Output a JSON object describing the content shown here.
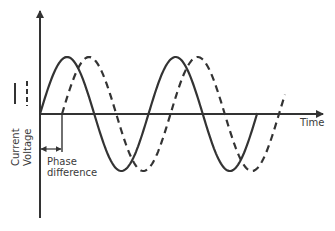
{
  "diagram": {
    "title": "",
    "axes": {
      "x_label": "Time",
      "y_label": ""
    },
    "legend": [
      {
        "name": "Current",
        "style": "solid",
        "color": "#333333"
      },
      {
        "name": "Voltage",
        "style": "dashed",
        "color": "#333333"
      }
    ],
    "annotation": {
      "line1": "Phase",
      "line2": "difference"
    },
    "colors": {
      "stroke": "#333333",
      "text": "#3a3a3a",
      "background": "#ffffff"
    }
  },
  "chart_data": {
    "type": "line",
    "title": "",
    "xlabel": "Time",
    "ylabel": "",
    "grid": false,
    "legend_position": "left, vertical",
    "series": [
      {
        "name": "Current",
        "style": "solid",
        "waveform": "sine",
        "cycles": 2,
        "phase_offset": 0
      },
      {
        "name": "Voltage",
        "style": "dashed",
        "waveform": "sine",
        "cycles": 2,
        "phase_offset": "lags current by ~0.2 period"
      }
    ],
    "annotations": [
      "Phase difference"
    ]
  }
}
